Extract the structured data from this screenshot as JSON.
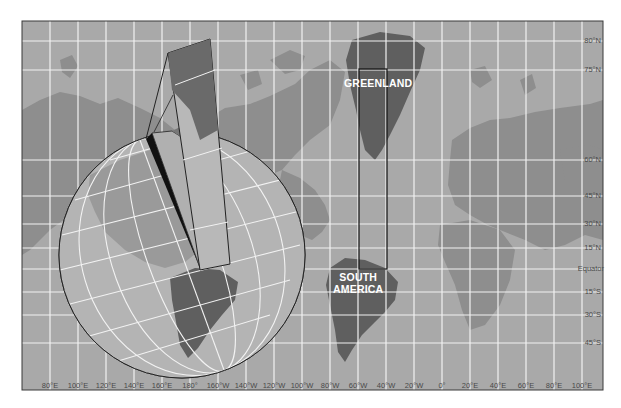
{
  "map": {
    "title": "Mercator projection with globe inset",
    "colors": {
      "ocean": "#a9a9a9",
      "land": "#8e8e8e",
      "land_highlight": "#5f5f5f",
      "grid": "#f2f2f2",
      "frame": "#3a3a3a",
      "label": "#4a4a4a"
    },
    "region_labels": {
      "greenland": "GREENLAND",
      "south_america_line1": "SOUTH",
      "south_america_line2": "AMERICA"
    },
    "latitude_labels": [
      {
        "text": "80°N",
        "y": 41
      },
      {
        "text": "75°N",
        "y": 70
      },
      {
        "text": "60°N",
        "y": 160
      },
      {
        "text": "45°N",
        "y": 196
      },
      {
        "text": "30°N",
        "y": 224
      },
      {
        "text": "15°N",
        "y": 248
      },
      {
        "text": "Equator",
        "y": 269
      },
      {
        "text": "15°S",
        "y": 292
      },
      {
        "text": "30°S",
        "y": 315
      },
      {
        "text": "45°S",
        "y": 343
      }
    ],
    "longitude_labels": [
      {
        "text": "80°E",
        "x": 50
      },
      {
        "text": "100°E",
        "x": 78
      },
      {
        "text": "120°E",
        "x": 106
      },
      {
        "text": "140°E",
        "x": 134
      },
      {
        "text": "160°E",
        "x": 162
      },
      {
        "text": "180°",
        "x": 190
      },
      {
        "text": "160°W",
        "x": 218
      },
      {
        "text": "140°W",
        "x": 246
      },
      {
        "text": "120°W",
        "x": 274
      },
      {
        "text": "100°W",
        "x": 302
      },
      {
        "text": "80°W",
        "x": 330
      },
      {
        "text": "60°W",
        "x": 358
      },
      {
        "text": "40°W",
        "x": 386
      },
      {
        "text": "20°W",
        "x": 414
      },
      {
        "text": "0°",
        "x": 442
      },
      {
        "text": "20°E",
        "x": 470
      },
      {
        "text": "40°E",
        "x": 498
      },
      {
        "text": "60°E",
        "x": 526
      },
      {
        "text": "80°E",
        "x": 554
      },
      {
        "text": "100°E",
        "x": 582
      }
    ]
  }
}
